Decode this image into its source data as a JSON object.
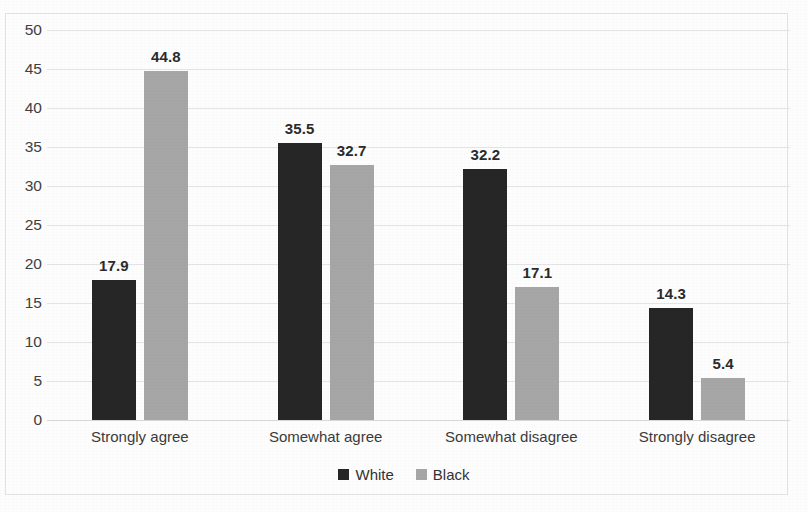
{
  "chart_data": {
    "type": "bar",
    "title": "",
    "xlabel": "",
    "ylabel": "",
    "ylim": [
      0,
      50
    ],
    "ytick_step": 5,
    "yticks": [
      "0",
      "5",
      "10",
      "15",
      "20",
      "25",
      "30",
      "35",
      "40",
      "45",
      "50"
    ],
    "grid": true,
    "legend_position": "bottom-center",
    "categories": [
      "Strongly agree",
      "Somewhat agree",
      "Somewhat disagree",
      "Strongly disagree"
    ],
    "series": [
      {
        "name": "White",
        "color": "#262626",
        "values": [
          17.9,
          35.5,
          32.2,
          14.3
        ],
        "labels": [
          "17.9",
          "35.5",
          "32.2",
          "14.3"
        ]
      },
      {
        "name": "Black",
        "color": "#a6a6a6",
        "values": [
          44.8,
          32.7,
          17.1,
          5.4
        ],
        "labels": [
          "44.8",
          "32.7",
          "17.1",
          "5.4"
        ]
      }
    ]
  },
  "legend": {
    "entries": [
      {
        "label": "White",
        "swatch": "#262626"
      },
      {
        "label": "Black",
        "swatch": "#a6a6a6"
      }
    ]
  },
  "colors": {
    "series_white": "#262626",
    "series_black": "#a6a6a6",
    "gridline": "#e4e4e6",
    "axis_text": "#404040",
    "background": "#fdfdfd",
    "frame_border": "#e2e2e2"
  }
}
